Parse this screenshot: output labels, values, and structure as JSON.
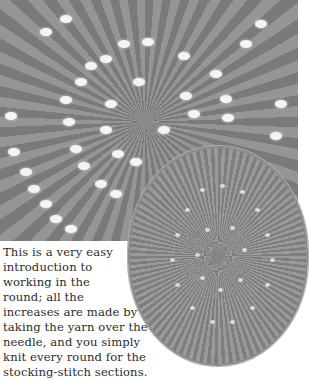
{
  "images": {
    "main_photo": "close-up of knitted lace eyelet swirl pattern in grey yarn",
    "inset_photo": "circular knitted beret top view with eyelet spiral"
  },
  "caption": {
    "lines": [
      "This is a very easy",
      "introduction to",
      "working in the",
      "round; all the",
      "increases are made by",
      "taking the yarn over the",
      "needle, and you simply",
      "knit every round for the",
      "stocking-stitch sections."
    ]
  },
  "colors": {
    "yarn": "#8a8a8a",
    "eyelet": "#f4f4f4",
    "text": "#2b2b2b",
    "background": "#ffffff"
  }
}
